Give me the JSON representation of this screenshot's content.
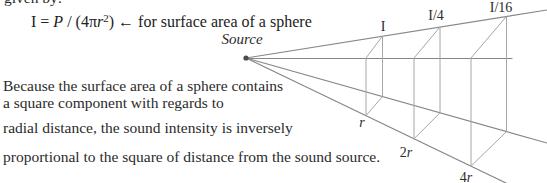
{
  "clipped_top_line": "given by:",
  "formula": {
    "lhs": "I = ",
    "P": "P",
    "mid": " / (4π",
    "r": "r",
    "sup": "2",
    "close": ") ",
    "arrow": "←",
    "annotation": " for surface area of a sphere"
  },
  "paragraph": {
    "lines": [
      "Because the surface area of a sphere contains",
      "a square component with regards to",
      "radial distance, the sound intensity is inversely",
      "proportional to the square of distance from the sound source."
    ]
  },
  "diagram": {
    "source_label": "Source",
    "intensity_labels": [
      {
        "label": "I",
        "at_distance": "r"
      },
      {
        "label": "I/4",
        "at_distance": "2r"
      },
      {
        "label": "I/16",
        "at_distance": "4r"
      }
    ],
    "distance_labels": [
      {
        "prefix": "",
        "symbol": "r"
      },
      {
        "prefix": "2",
        "symbol": "r"
      },
      {
        "prefix": "4",
        "symbol": "r"
      }
    ],
    "colors": {
      "ray": "#878787",
      "square_edge": "#a6a6a6",
      "dot": "#4d4d4d",
      "text": "#2b2b2b"
    }
  }
}
